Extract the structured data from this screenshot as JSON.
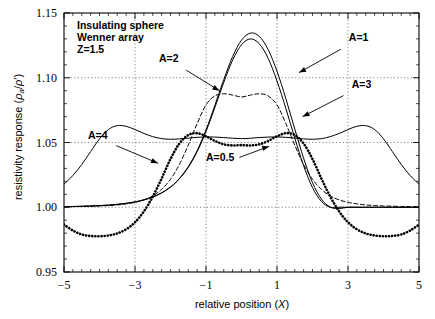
{
  "chart_data": {
    "type": "line",
    "title": "",
    "annotation_title_lines": [
      "Insulating sphere",
      "Wenner array",
      "Z=1.5"
    ],
    "xlabel": "relative position (X)",
    "ylabel": "resistivity response (ρₐ/ρ')",
    "xlim": [
      -5,
      5
    ],
    "ylim": [
      0.95,
      1.15
    ],
    "xticks": [
      -5,
      -3,
      -1,
      1,
      3,
      5
    ],
    "xticklabels": [
      "−5",
      "−3",
      "−1",
      "1",
      "3",
      "5"
    ],
    "yticks": [
      0.95,
      1.0,
      1.05,
      1.1,
      1.15
    ],
    "yticklabels": [
      "0.95",
      "1.00",
      "1.05",
      "1.10",
      "1.15"
    ],
    "grid": true,
    "grid_style": "dotted",
    "minor_ticks": true,
    "legend": "inline-annotations",
    "x": [
      -5.0,
      -4.75,
      -4.5,
      -4.25,
      -4.0,
      -3.75,
      -3.5,
      -3.25,
      -3.0,
      -2.75,
      -2.5,
      -2.25,
      -2.0,
      -1.75,
      -1.5,
      -1.25,
      -1.0,
      -0.75,
      -0.5,
      -0.25,
      0.0,
      0.25,
      0.5,
      0.75,
      1.0,
      1.25,
      1.5,
      1.75,
      2.0,
      2.25,
      2.5,
      2.75,
      3.0,
      3.25,
      3.5,
      3.75,
      4.0,
      4.25,
      4.5,
      4.75,
      5.0
    ],
    "series": [
      {
        "name": "A=1",
        "label": "A=1",
        "style": "solid",
        "width": 1,
        "values": [
          1.0005,
          1.0006,
          1.0008,
          1.001,
          1.0013,
          1.0017,
          1.0023,
          1.0031,
          1.0042,
          1.0058,
          1.008,
          1.0112,
          1.0157,
          1.0222,
          1.0313,
          1.0437,
          1.0597,
          1.0787,
          1.0986,
          1.1164,
          1.129,
          1.1345,
          1.132,
          1.1218,
          1.105,
          1.0838,
          1.0605,
          1.0378,
          1.019,
          1.0063,
          1.0001,
          0.999,
          1.0,
          1.0,
          1.0,
          1.0,
          1.0,
          1.0,
          1.0,
          1.0,
          1.0
        ]
      },
      {
        "name": "A=2",
        "label": "A=2",
        "style": "solid",
        "width": 1,
        "values": [
          1.0004,
          1.0005,
          1.0007,
          1.0009,
          1.0012,
          1.0016,
          1.0021,
          1.0029,
          1.004,
          1.0056,
          1.0078,
          1.011,
          1.0155,
          1.0219,
          1.0308,
          1.0429,
          1.0585,
          1.077,
          1.0964,
          1.1136,
          1.1255,
          1.13,
          1.1263,
          1.115,
          1.0975,
          1.0762,
          1.0535,
          1.032,
          1.0152,
          1.0045,
          1.0,
          1.0,
          1.0,
          1.0,
          1.0,
          1.0,
          1.0,
          1.0,
          1.0,
          1.0,
          1.0
        ]
      },
      {
        "name": "A=3",
        "label": "A=3",
        "style": "dashed",
        "width": 1,
        "values": [
          1.0004,
          1.0005,
          1.0006,
          1.0008,
          1.001,
          1.0013,
          1.0018,
          1.0026,
          1.0038,
          1.0057,
          1.0088,
          1.0138,
          1.0216,
          1.033,
          1.048,
          1.0646,
          1.079,
          1.086,
          1.0876,
          1.0866,
          1.0852,
          1.0866,
          1.0876,
          1.086,
          1.079,
          1.0646,
          1.048,
          1.033,
          1.0216,
          1.0138,
          1.0088,
          1.0057,
          1.0038,
          1.0026,
          1.0018,
          1.0013,
          1.001,
          1.0008,
          1.0006,
          1.0005,
          1.0004
        ]
      },
      {
        "name": "A=4",
        "label": "A=4",
        "style": "solid",
        "width": 1,
        "values": [
          1.0178,
          1.0245,
          1.033,
          1.043,
          1.0528,
          1.06,
          1.063,
          1.0625,
          1.06,
          1.057,
          1.0545,
          1.053,
          1.0525,
          1.0528,
          1.0534,
          1.054,
          1.0543,
          1.0542,
          1.0538,
          1.0533,
          1.053,
          1.0533,
          1.0538,
          1.0542,
          1.0543,
          1.054,
          1.0534,
          1.0528,
          1.0525,
          1.053,
          1.0545,
          1.057,
          1.06,
          1.0625,
          1.063,
          1.06,
          1.0528,
          1.043,
          1.033,
          1.0245,
          1.0178
        ]
      },
      {
        "name": "A=0.5",
        "label": "A=0.5",
        "style": "dotted-thick",
        "width": 2.6,
        "values": [
          0.9866,
          0.982,
          0.979,
          0.9778,
          0.9776,
          0.9782,
          0.9798,
          0.983,
          0.9884,
          0.9968,
          1.0082,
          1.0222,
          1.0372,
          1.0492,
          1.0558,
          1.0572,
          1.0548,
          1.0512,
          1.0486,
          1.0477,
          1.048,
          1.0477,
          1.0486,
          1.0512,
          1.0548,
          1.0572,
          1.0558,
          1.0492,
          1.0372,
          1.0222,
          1.0082,
          0.9968,
          0.9884,
          0.983,
          0.9798,
          0.9782,
          0.9776,
          0.9778,
          0.979,
          0.982,
          0.9866
        ]
      }
    ],
    "annotations": [
      {
        "name": "label-A1",
        "text": "A=1",
        "x": 3.3,
        "y": 1.128,
        "arrow_to": [
          1.62,
          1.104
        ]
      },
      {
        "name": "label-A2",
        "text": "A=2",
        "x": -2.05,
        "y": 1.112,
        "arrow_to": [
          -0.62,
          1.09
        ]
      },
      {
        "name": "label-A3",
        "text": "A=3",
        "x": 3.38,
        "y": 1.092,
        "arrow_to": [
          1.72,
          1.07
        ]
      },
      {
        "name": "label-A4",
        "text": "A=4",
        "x": -4.05,
        "y": 1.053,
        "arrow_to": [
          -2.35,
          1.034
        ]
      },
      {
        "name": "label-A05",
        "text": "A=0.5",
        "x": -0.6,
        "y": 1.036,
        "arrow_to": [
          0.78,
          1.047
        ]
      }
    ]
  },
  "axis_text": {
    "y_label_prefix": "resistivity response (",
    "y_label_rho_a": "ρ",
    "y_label_sub_a": "a",
    "y_label_mid": "/",
    "y_label_rho_p": "ρ'",
    "y_label_suffix": ")",
    "x_label_prefix": "relative position (",
    "x_label_var": "X",
    "x_label_suffix": ")"
  },
  "colors": {
    "line": "#000000",
    "grid": "#555555",
    "axis": "#000000",
    "background": "#ffffff"
  }
}
